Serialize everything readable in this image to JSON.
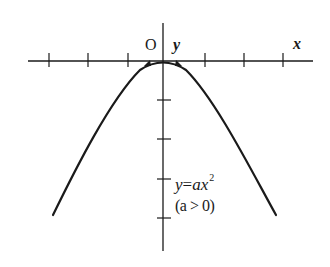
{
  "diagram": {
    "type": "function-graph",
    "axes": {
      "x_label": "x",
      "y_label": "y",
      "origin_label": "O",
      "x_ticks_left": 3,
      "x_ticks_right": 3,
      "y_ticks_below": 4
    },
    "curve": {
      "equation_lhs": "y",
      "equation_eq": "=",
      "equation_rhs": "ax",
      "equation_exp": "2",
      "condition": "(a > 0)",
      "shape": "downward-opening parabola with vertex at origin",
      "color": "#1a1a1a"
    },
    "colors": {
      "background": "#ffffff",
      "ink": "#1a1a1a"
    }
  }
}
